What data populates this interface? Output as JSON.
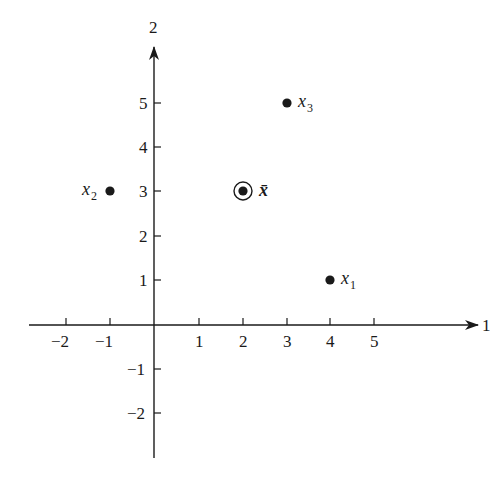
{
  "diagram": {
    "axes": {
      "x_axis_label": "1",
      "y_axis_label": "2",
      "x_ticks": [
        "-2",
        "-1",
        "1",
        "2",
        "3",
        "4",
        "5"
      ],
      "x_tick_values": [
        -2,
        -1,
        1,
        2,
        3,
        4,
        5
      ],
      "y_ticks": [
        "5",
        "4",
        "3",
        "2",
        "1",
        "-1",
        "-2"
      ],
      "y_tick_values": [
        5,
        4,
        3,
        2,
        1,
        -1,
        -2
      ],
      "x_tick_text": {
        "m2": "−2",
        "m1": "−1",
        "p1": "1",
        "p2": "2",
        "p3": "3",
        "p4": "4",
        "p5": "5"
      },
      "y_tick_text": {
        "p5": "5",
        "p4": "4",
        "p3": "3",
        "p2": "2",
        "p1": "1",
        "m1": "−1",
        "m2": "−2"
      }
    },
    "points": [
      {
        "name": "x",
        "subscript": "1",
        "x": 4,
        "y": 1
      },
      {
        "name": "x",
        "subscript": "2",
        "x": -1,
        "y": 3
      },
      {
        "name": "x",
        "subscript": "3",
        "x": 3,
        "y": 5
      }
    ],
    "mean": {
      "label": "x̄",
      "x": 2,
      "y": 3,
      "marker": "circled-dot"
    },
    "colors": {
      "ink": "#1a1a1a",
      "background": "#ffffff"
    }
  }
}
